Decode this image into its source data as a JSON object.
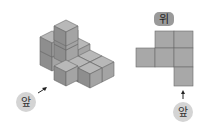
{
  "figure": {
    "isometric_view": {
      "front_label": "앞",
      "cube_count_visible": 9
    },
    "top_view": {
      "title": "위",
      "front_label": "앞",
      "grid": [
        [
          0,
          1,
          1
        ],
        [
          1,
          1,
          1
        ],
        [
          0,
          0,
          1
        ]
      ]
    }
  },
  "colors": {
    "cube_top": "#b8b8b8",
    "cube_left": "#8e8e8e",
    "cube_right": "#a4a4a4",
    "edge": "#6a6a6a",
    "top_view_cell": "#a8a8a8",
    "label_circle": "#d4d4d4",
    "label_pill": "#9a9a9a"
  }
}
